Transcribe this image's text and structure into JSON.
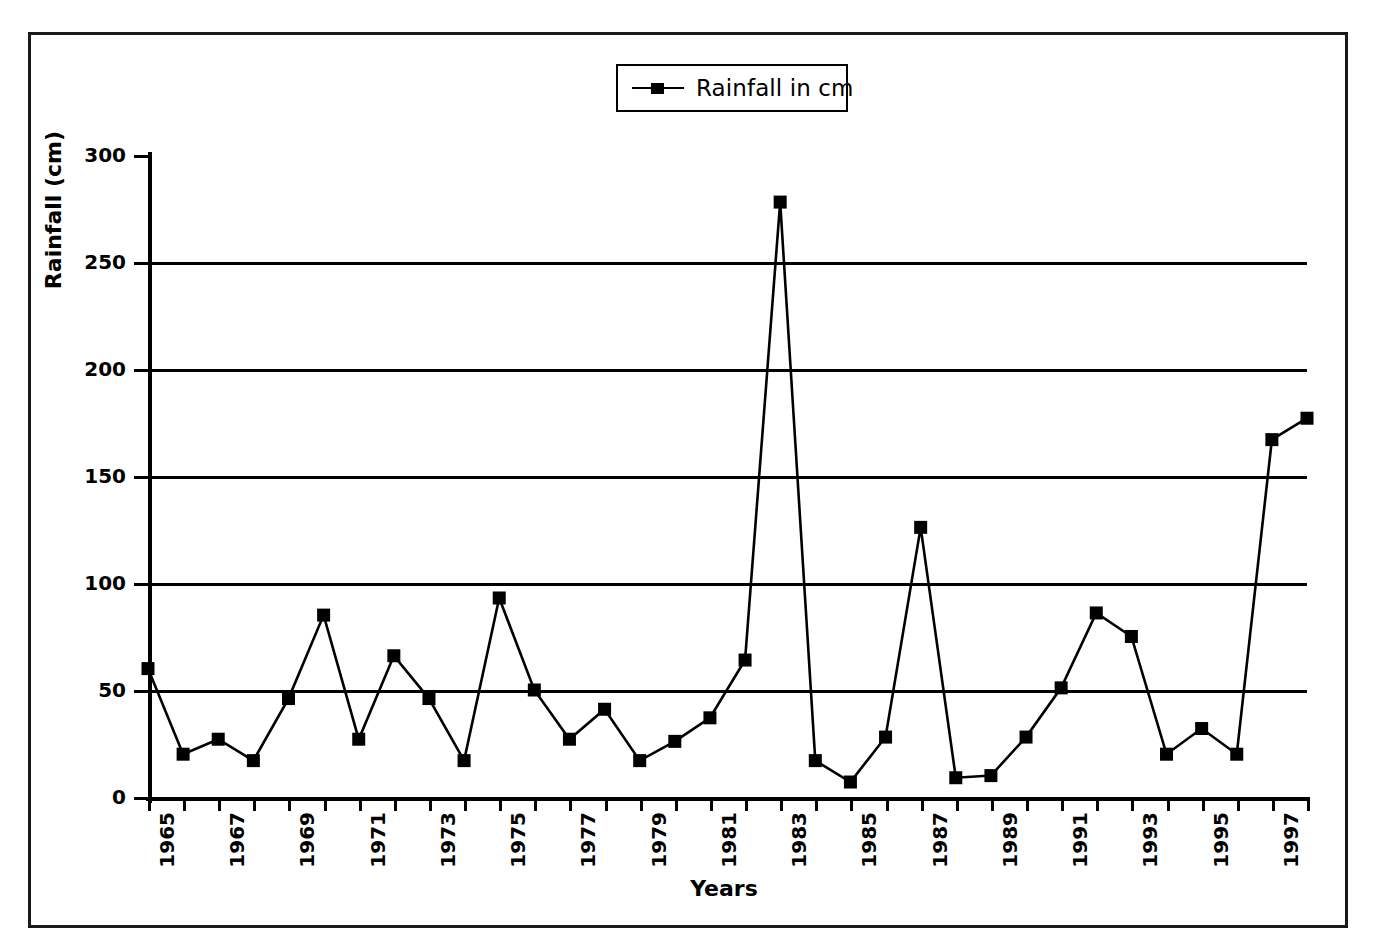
{
  "figure": {
    "frame": true,
    "background": "#ffffff",
    "ink_color": "#000000"
  },
  "legend": {
    "label": "Rainfall in cm",
    "marker": "filled-square",
    "position": "top-center",
    "boxed": true
  },
  "axes": {
    "y_title": "Rainfall (cm)",
    "x_title": "Years",
    "y_ticks": [
      "0",
      "50",
      "100",
      "150",
      "200",
      "250",
      "300"
    ],
    "x_tick_labels": [
      "1965",
      "1967",
      "1969",
      "1971",
      "1973",
      "1975",
      "1977",
      "1979",
      "1981",
      "1983",
      "1985",
      "1987",
      "1989",
      "1991",
      "1993",
      "1995",
      "1997"
    ],
    "x_label_rotation_deg": -90,
    "gridlines_at": [
      "50",
      "100",
      "150",
      "200",
      "250"
    ]
  },
  "chart_data": {
    "type": "line",
    "title": "",
    "xlabel": "Years",
    "ylabel": "Rainfall (cm)",
    "ylim": [
      0,
      300
    ],
    "ytick_step": 50,
    "grid": true,
    "legend_position": "top-center",
    "series": [
      {
        "name": "Rainfall in cm",
        "marker": "square",
        "color": "#000000",
        "x": [
          1965,
          1966,
          1967,
          1968,
          1969,
          1970,
          1971,
          1972,
          1973,
          1974,
          1975,
          1976,
          1977,
          1978,
          1979,
          1980,
          1981,
          1982,
          1983,
          1984,
          1985,
          1986,
          1987,
          1988,
          1989,
          1990,
          1991,
          1992,
          1993,
          1994,
          1995,
          1996,
          1997,
          1998
        ],
        "values": [
          60,
          20,
          27,
          17,
          46,
          85,
          27,
          66,
          46,
          17,
          93,
          50,
          27,
          41,
          17,
          26,
          37,
          64,
          278,
          17,
          7,
          28,
          126,
          9,
          10,
          28,
          51,
          86,
          75,
          20,
          32,
          20,
          167,
          177
        ]
      }
    ]
  }
}
